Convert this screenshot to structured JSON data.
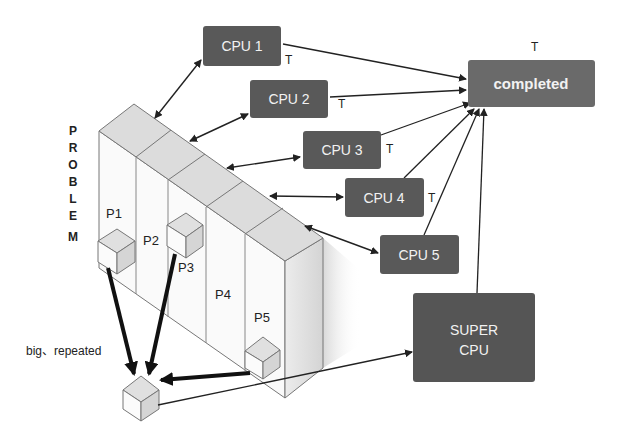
{
  "diagram": {
    "vertical_label": [
      "P",
      "R",
      "O",
      "B",
      "L",
      "E",
      "M"
    ],
    "partitions": [
      "P1",
      "P2",
      "P3",
      "P4",
      "P5"
    ],
    "cpus": [
      {
        "label": "CPU 1",
        "t": "T"
      },
      {
        "label": "CPU 2",
        "t": "T"
      },
      {
        "label": "CPU 3",
        "t": "T"
      },
      {
        "label": "CPU 4",
        "t": "T"
      },
      {
        "label": "CPU 5",
        "t": ""
      }
    ],
    "completed": {
      "label": "completed",
      "t": "T"
    },
    "super_cpu": {
      "line1": "SUPER",
      "line2": "CPU"
    },
    "note": "big、repeated",
    "colors": {
      "box": "#595959",
      "box_text": "#f2f2f2",
      "wall_top": "#d9d9d9",
      "wall_front": "#f7f7f7",
      "line": "#222222"
    }
  }
}
